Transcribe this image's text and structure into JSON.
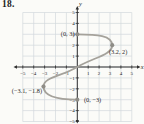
{
  "problem_number": "18.",
  "colors": {
    "background": "#fbfbf8",
    "grid": "#d3d8dd",
    "axis": "#2f2f2f",
    "curve": "#a5a29b",
    "point": "#8f8d87",
    "text": "#1f1f1f"
  },
  "chart_data": {
    "type": "line",
    "title": "",
    "xlabel": "x",
    "ylabel": "y",
    "xlim": [
      -5,
      5
    ],
    "ylim": [
      -5,
      5
    ],
    "grid": true,
    "x_ticks": [
      -5,
      -4,
      -3,
      -2,
      -1,
      1,
      2,
      3,
      4,
      5
    ],
    "y_ticks": [
      5,
      4,
      3,
      2,
      1,
      -1,
      -2,
      -3,
      -4,
      -5
    ],
    "curve_description": "sideways S-shaped curve from (0,3) bulging right to (3.2,2), passing through the origin, bulging left to (-3.1,-1.8), ending at (0,-3)",
    "curve_bezier": [
      [
        0,
        3
      ],
      [
        1.8,
        3.0
      ],
      [
        3.2,
        2.9
      ],
      [
        3.2,
        2
      ],
      [
        3.2,
        1.1
      ],
      [
        1.4,
        0.85
      ],
      [
        0,
        0
      ],
      [
        -1.4,
        -0.85
      ],
      [
        -3.1,
        -0.9
      ],
      [
        -3.1,
        -1.8
      ],
      [
        -3.1,
        -2.7
      ],
      [
        -1.8,
        -3.0
      ],
      [
        0,
        -3
      ]
    ],
    "labeled_points": [
      {
        "x": 0,
        "y": 3,
        "label": "(0, 3)"
      },
      {
        "x": 3.2,
        "y": 2,
        "label": "(3.2, 2)"
      },
      {
        "x": -3.1,
        "y": -1.8,
        "label": "(−3.1, −1.8)"
      },
      {
        "x": 0,
        "y": -3,
        "label": "(0, −3)"
      }
    ]
  }
}
